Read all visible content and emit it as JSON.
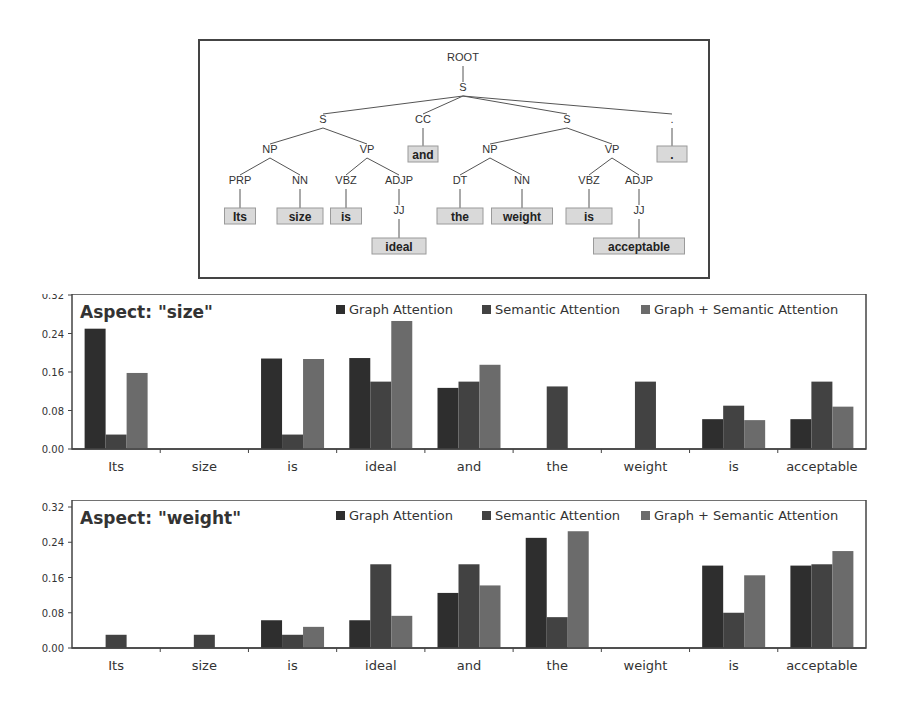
{
  "parse_tree": {
    "nodes": [
      {
        "id": "root",
        "label": "ROOT",
        "x": 263,
        "y": 20
      },
      {
        "id": "s0",
        "label": "S",
        "x": 263,
        "y": 50
      },
      {
        "id": "s1",
        "label": "S",
        "x": 123,
        "y": 82
      },
      {
        "id": "cc",
        "label": "CC",
        "x": 223,
        "y": 82
      },
      {
        "id": "s2",
        "label": "S",
        "x": 367,
        "y": 82
      },
      {
        "id": "dotp",
        "label": ".",
        "x": 472,
        "y": 82
      },
      {
        "id": "np1",
        "label": "NP",
        "x": 70,
        "y": 112
      },
      {
        "id": "vp1",
        "label": "VP",
        "x": 167,
        "y": 112
      },
      {
        "id": "np2",
        "label": "NP",
        "x": 290,
        "y": 112
      },
      {
        "id": "vp2",
        "label": "VP",
        "x": 412,
        "y": 112
      },
      {
        "id": "prp",
        "label": "PRP",
        "x": 40,
        "y": 143
      },
      {
        "id": "nn1",
        "label": "NN",
        "x": 100,
        "y": 143
      },
      {
        "id": "vbz1",
        "label": "VBZ",
        "x": 146,
        "y": 143
      },
      {
        "id": "adjp1",
        "label": "ADJP",
        "x": 199,
        "y": 143
      },
      {
        "id": "dt",
        "label": "DT",
        "x": 260,
        "y": 143
      },
      {
        "id": "nn2",
        "label": "NN",
        "x": 322,
        "y": 143
      },
      {
        "id": "vbz2",
        "label": "VBZ",
        "x": 389,
        "y": 143
      },
      {
        "id": "adjp2",
        "label": "ADJP",
        "x": 439,
        "y": 143
      },
      {
        "id": "jj1",
        "label": "JJ",
        "x": 199,
        "y": 173
      },
      {
        "id": "jj2",
        "label": "JJ",
        "x": 439,
        "y": 173
      }
    ],
    "edges": [
      [
        "root",
        "s0"
      ],
      [
        "s0",
        "s1"
      ],
      [
        "s0",
        "cc"
      ],
      [
        "s0",
        "s2"
      ],
      [
        "s0",
        "dotp"
      ],
      [
        "s1",
        "np1"
      ],
      [
        "s1",
        "vp1"
      ],
      [
        "s2",
        "np2"
      ],
      [
        "s2",
        "vp2"
      ],
      [
        "np1",
        "prp"
      ],
      [
        "np1",
        "nn1"
      ],
      [
        "vp1",
        "vbz1"
      ],
      [
        "vp1",
        "adjp1"
      ],
      [
        "np2",
        "dt"
      ],
      [
        "np2",
        "nn2"
      ],
      [
        "vp2",
        "vbz2"
      ],
      [
        "vp2",
        "adjp2"
      ],
      [
        "adjp1",
        "jj1"
      ],
      [
        "adjp2",
        "jj2"
      ]
    ],
    "tokens": [
      {
        "text": "and",
        "parent": "cc",
        "x": 223,
        "y": 113,
        "w": 30
      },
      {
        "text": ".",
        "parent": "dotp",
        "x": 472,
        "y": 113,
        "w": 30
      },
      {
        "text": "Its",
        "parent": "prp",
        "x": 40,
        "y": 175,
        "w": 31
      },
      {
        "text": "size",
        "parent": "nn1",
        "x": 100,
        "y": 175,
        "w": 46
      },
      {
        "text": "is",
        "parent": "vbz1",
        "x": 146,
        "y": 175,
        "w": 31
      },
      {
        "text": "the",
        "parent": "dt",
        "x": 260,
        "y": 175,
        "w": 46
      },
      {
        "text": "weight",
        "parent": "nn2",
        "x": 322,
        "y": 175,
        "w": 61
      },
      {
        "text": "is",
        "parent": "vbz2",
        "x": 389,
        "y": 175,
        "w": 46
      },
      {
        "text": "ideal",
        "parent": "jj1",
        "x": 199,
        "y": 205,
        "w": 54
      },
      {
        "text": "acceptable",
        "parent": "jj2",
        "x": 439,
        "y": 205,
        "w": 91
      }
    ]
  },
  "chart_data": [
    {
      "type": "bar",
      "title": "Aspect: \"size\"",
      "xlabel": "",
      "ylabel": "",
      "ylim": [
        0,
        0.32
      ],
      "yticks": [
        "0.00",
        "0.08",
        "0.16",
        "0.24",
        "0.32"
      ],
      "legend_position": "top-right",
      "grid": false,
      "categories": [
        "Its",
        "size",
        "is",
        "ideal",
        "and",
        "the",
        "weight",
        "is",
        "acceptable"
      ],
      "series": [
        {
          "name": "Graph Attention",
          "color": "#2e2e2e",
          "values": [
            0.25,
            0,
            0.188,
            0.189,
            0.127,
            0,
            0,
            0.062,
            0.062
          ]
        },
        {
          "name": "Semantic Attention",
          "color": "#424242",
          "values": [
            0.03,
            0,
            0.03,
            0.14,
            0.14,
            0.13,
            0.14,
            0.09,
            0.14
          ]
        },
        {
          "name": "Graph + Semantic Attention",
          "color": "#6b6b6b",
          "values": [
            0.158,
            0,
            0.187,
            0.266,
            0.175,
            0,
            0,
            0.06,
            0.088
          ]
        }
      ]
    },
    {
      "type": "bar",
      "title": "Aspect: \"weight\"",
      "xlabel": "",
      "ylabel": "",
      "ylim": [
        0,
        0.32
      ],
      "yticks": [
        "0.00",
        "0.08",
        "0.16",
        "0.24",
        "0.32"
      ],
      "legend_position": "top-right",
      "grid": false,
      "categories": [
        "Its",
        "size",
        "is",
        "ideal",
        "and",
        "the",
        "weight",
        "is",
        "acceptable"
      ],
      "series": [
        {
          "name": "Graph Attention",
          "color": "#2e2e2e",
          "values": [
            0,
            0,
            0.063,
            0.063,
            0.125,
            0.25,
            0,
            0.187,
            0.187
          ]
        },
        {
          "name": "Semantic Attention",
          "color": "#424242",
          "values": [
            0.03,
            0.03,
            0.03,
            0.19,
            0.19,
            0.07,
            0,
            0.08,
            0.19
          ]
        },
        {
          "name": "Graph + Semantic Attention",
          "color": "#6b6b6b",
          "values": [
            0,
            0,
            0.048,
            0.073,
            0.142,
            0.265,
            0,
            0.165,
            0.22
          ]
        }
      ]
    }
  ],
  "layout": {
    "charts": [
      {
        "top": 294,
        "height": 180,
        "plot_top": 1,
        "plot_bottom": 155,
        "title_y": 24
      },
      {
        "top": 500,
        "height": 180,
        "plot_top": 7,
        "plot_bottom": 148,
        "title_y": 24
      }
    ]
  }
}
